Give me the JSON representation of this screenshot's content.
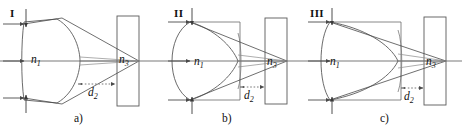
{
  "figure": {
    "background": "#ffffff",
    "line_color": "#4a4a4a",
    "axis_color": "#999999",
    "text_color": "#111111"
  },
  "panels": [
    {
      "id": "a",
      "roman_label": "I",
      "caption": "a)",
      "lens_label": "n",
      "lens_label_sub": "1",
      "block_label": "n",
      "block_label_sub": "3",
      "gap_label": "d",
      "gap_label_sub": "2",
      "lens_type": "meniscus-thick",
      "ray_count": 3,
      "focus_position": "block-right-edge"
    },
    {
      "id": "b",
      "roman_label": "II",
      "caption": "b)",
      "lens_label": "n",
      "lens_label_sub": "1",
      "block_label": "n",
      "block_label_sub": "3",
      "gap_label": "d",
      "gap_label_sub": "2",
      "lens_type": "hemispherical-convex",
      "ray_count": 3,
      "focus_position": "block-right-edge"
    },
    {
      "id": "c",
      "roman_label": "III",
      "caption": "c)",
      "lens_label": "n",
      "lens_label_sub": "1",
      "block_label": "n",
      "block_label_sub": "3",
      "gap_label": "d",
      "gap_label_sub": "2",
      "lens_type": "concave-left-thick",
      "ray_count": 3,
      "focus_position": "block-right-edge"
    }
  ]
}
